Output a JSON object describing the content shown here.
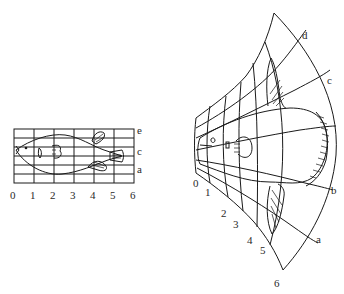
{
  "left_panel": {
    "name": "original-fish-grid",
    "x_labels": [
      "0",
      "1",
      "2",
      "3",
      "4",
      "5",
      "6"
    ],
    "y_labels": [
      "e",
      "c",
      "a"
    ]
  },
  "right_panel": {
    "name": "transformed-fish-grid",
    "x_labels": [
      "0",
      "1",
      "2",
      "3",
      "4",
      "5",
      "6"
    ],
    "y_labels": [
      "d",
      "c",
      "b",
      "a"
    ]
  },
  "colors": {
    "line": "#1a1a1a",
    "text": "#2a2a2a",
    "background": "#ffffff"
  }
}
